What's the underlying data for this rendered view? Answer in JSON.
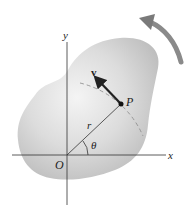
{
  "diagram": {
    "labels": {
      "y_axis": "y",
      "x_axis": "x",
      "origin": "O",
      "point": "P",
      "radius": "r",
      "angle": "θ",
      "velocity": "v"
    },
    "colors": {
      "body_fill": "#c8c8c8",
      "body_highlight": "#f2f2f2",
      "axis": "#333333",
      "velocity_arrow": "#222222",
      "rotation_arrow": "#8a8a8a",
      "dashed_path": "#888888"
    },
    "icons": {
      "rotation_direction": "curved-arrow-counterclockwise"
    }
  }
}
